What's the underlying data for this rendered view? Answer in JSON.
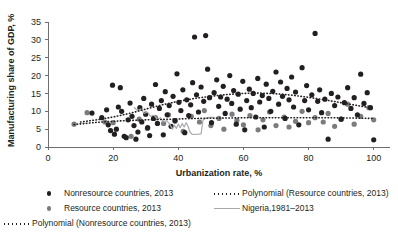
{
  "chart_data": {
    "type": "scatter",
    "title": "",
    "xlabel": "Urbanization rate, %",
    "ylabel": "Manufacturing share of GDP, %",
    "xlim": [
      0,
      105
    ],
    "ylim": [
      0,
      35
    ],
    "xticks": [
      0,
      20,
      40,
      60,
      80,
      100
    ],
    "yticks": [
      0,
      5,
      10,
      15,
      20,
      25,
      30,
      35
    ],
    "grid": false,
    "legend_position": "below",
    "series": [
      {
        "name": "Nonresource countries, 2013",
        "type": "scatter",
        "color": "#231f20",
        "points": [
          [
            13.5,
            9.5
          ],
          [
            16.5,
            8.2
          ],
          [
            18.0,
            10.4
          ],
          [
            18.5,
            6.2
          ],
          [
            19.2,
            4.6
          ],
          [
            19.8,
            17.3
          ],
          [
            20.4,
            3.6
          ],
          [
            21.0,
            5.0
          ],
          [
            21.6,
            11.2
          ],
          [
            22.2,
            16.6
          ],
          [
            22.6,
            10.0
          ],
          [
            23.4,
            3.0
          ],
          [
            24.0,
            2.6
          ],
          [
            24.6,
            7.6
          ],
          [
            25.2,
            12.3
          ],
          [
            25.8,
            8.6
          ],
          [
            26.4,
            6.0
          ],
          [
            27.0,
            2.2
          ],
          [
            27.6,
            4.2
          ],
          [
            28.2,
            11.0
          ],
          [
            28.8,
            7.0
          ],
          [
            29.4,
            13.6
          ],
          [
            30.0,
            9.2
          ],
          [
            30.6,
            5.4
          ],
          [
            31.2,
            3.2
          ],
          [
            31.8,
            12.0
          ],
          [
            32.4,
            8.0
          ],
          [
            33.0,
            17.5
          ],
          [
            33.6,
            6.6
          ],
          [
            34.2,
            10.8
          ],
          [
            34.8,
            13.0
          ],
          [
            35.4,
            3.4
          ],
          [
            36.0,
            15.5
          ],
          [
            36.6,
            9.0
          ],
          [
            37.2,
            11.6
          ],
          [
            37.8,
            5.8
          ],
          [
            38.4,
            14.2
          ],
          [
            39.0,
            7.4
          ],
          [
            39.6,
            20.5
          ],
          [
            40.2,
            12.5
          ],
          [
            40.8,
            10.2
          ],
          [
            41.4,
            16.0
          ],
          [
            42.0,
            4.0
          ],
          [
            42.6,
            13.2
          ],
          [
            43.2,
            8.8
          ],
          [
            43.8,
            11.8
          ],
          [
            44.4,
            18.0
          ],
          [
            45.0,
            30.8
          ],
          [
            45.6,
            14.6
          ],
          [
            46.2,
            9.8
          ],
          [
            47.0,
            16.8
          ],
          [
            47.8,
            12.8
          ],
          [
            48.4,
            31.2
          ],
          [
            49.0,
            21.8
          ],
          [
            49.6,
            13.8
          ],
          [
            50.2,
            6.8
          ],
          [
            51.0,
            15.2
          ],
          [
            51.8,
            18.8
          ],
          [
            52.4,
            11.4
          ],
          [
            53.0,
            14.0
          ],
          [
            53.8,
            17.0
          ],
          [
            54.4,
            9.4
          ],
          [
            55.0,
            13.4
          ],
          [
            55.8,
            20.0
          ],
          [
            56.4,
            12.2
          ],
          [
            57.0,
            15.8
          ],
          [
            57.8,
            6.4
          ],
          [
            58.4,
            14.8
          ],
          [
            59.0,
            10.6
          ],
          [
            59.8,
            18.4
          ],
          [
            60.4,
            4.8
          ],
          [
            61.0,
            13.0
          ],
          [
            61.8,
            16.2
          ],
          [
            62.4,
            11.0
          ],
          [
            63.0,
            15.0
          ],
          [
            63.8,
            8.4
          ],
          [
            64.4,
            19.2
          ],
          [
            65.0,
            12.6
          ],
          [
            65.8,
            14.4
          ],
          [
            66.4,
            5.6
          ],
          [
            67.0,
            17.6
          ],
          [
            67.8,
            13.6
          ],
          [
            68.4,
            10.0
          ],
          [
            69.0,
            15.6
          ],
          [
            70.0,
            21.0
          ],
          [
            70.8,
            12.0
          ],
          [
            71.4,
            18.2
          ],
          [
            72.0,
            14.2
          ],
          [
            72.8,
            8.0
          ],
          [
            73.4,
            16.4
          ],
          [
            74.0,
            13.2
          ],
          [
            74.8,
            19.6
          ],
          [
            75.4,
            11.2
          ],
          [
            76.0,
            15.4
          ],
          [
            77.0,
            6.2
          ],
          [
            78.0,
            22.2
          ],
          [
            78.8,
            13.0
          ],
          [
            79.4,
            17.2
          ],
          [
            80.0,
            10.4
          ],
          [
            81.0,
            14.6
          ],
          [
            82.0,
            31.8
          ],
          [
            82.8,
            12.8
          ],
          [
            83.4,
            16.0
          ],
          [
            84.0,
            9.6
          ],
          [
            85.0,
            13.4
          ],
          [
            86.0,
            2.2
          ],
          [
            87.0,
            15.0
          ],
          [
            88.0,
            11.6
          ],
          [
            89.0,
            14.0
          ],
          [
            90.0,
            7.8
          ],
          [
            91.0,
            12.4
          ],
          [
            92.0,
            16.6
          ],
          [
            93.0,
            10.8
          ],
          [
            94.0,
            13.8
          ],
          [
            95.0,
            9.0
          ],
          [
            96.0,
            20.4
          ],
          [
            97.0,
            12.2
          ],
          [
            98.0,
            15.2
          ],
          [
            99.0,
            11.0
          ],
          [
            100.0,
            2.0
          ]
        ]
      },
      {
        "name": "Resource countries, 2013",
        "type": "scatter",
        "color": "#7b7c7f",
        "points": [
          [
            8.0,
            6.4
          ],
          [
            12.0,
            9.6
          ],
          [
            17.5,
            7.0
          ],
          [
            20.0,
            6.8
          ],
          [
            25.5,
            3.0
          ],
          [
            28.0,
            7.8
          ],
          [
            30.5,
            5.2
          ],
          [
            33.0,
            8.2
          ],
          [
            35.5,
            6.6
          ],
          [
            37.0,
            9.0
          ],
          [
            39.0,
            7.2
          ],
          [
            41.5,
            4.4
          ],
          [
            44.0,
            8.6
          ],
          [
            46.5,
            7.0
          ],
          [
            48.0,
            10.2
          ],
          [
            50.0,
            6.0
          ],
          [
            52.5,
            8.0
          ],
          [
            54.0,
            5.0
          ],
          [
            56.5,
            9.2
          ],
          [
            58.0,
            7.4
          ],
          [
            60.0,
            6.2
          ],
          [
            62.0,
            8.8
          ],
          [
            64.5,
            4.8
          ],
          [
            66.0,
            7.6
          ],
          [
            68.0,
            9.8
          ],
          [
            70.0,
            6.0
          ],
          [
            72.5,
            8.4
          ],
          [
            74.0,
            5.6
          ],
          [
            76.0,
            7.2
          ],
          [
            78.0,
            10.0
          ],
          [
            80.0,
            6.8
          ],
          [
            82.0,
            8.2
          ],
          [
            84.5,
            7.0
          ],
          [
            86.0,
            9.4
          ],
          [
            88.0,
            5.8
          ],
          [
            90.0,
            7.8
          ],
          [
            92.0,
            12.0
          ],
          [
            94.0,
            6.4
          ],
          [
            96.0,
            8.6
          ],
          [
            98.5,
            11.0
          ],
          [
            100.0,
            7.6
          ]
        ]
      }
    ],
    "trendlines": [
      {
        "name": "Polynomial (Nonresource countries, 2013)",
        "style": "dotted",
        "color": "#231f20",
        "points": [
          [
            10,
            7.0
          ],
          [
            15,
            7.6
          ],
          [
            20,
            8.4
          ],
          [
            25,
            9.4
          ],
          [
            30,
            10.6
          ],
          [
            35,
            11.8
          ],
          [
            40,
            12.8
          ],
          [
            45,
            13.6
          ],
          [
            50,
            14.2
          ],
          [
            55,
            14.7
          ],
          [
            60,
            15.0
          ],
          [
            65,
            15.1
          ],
          [
            70,
            14.9
          ],
          [
            75,
            14.5
          ],
          [
            80,
            13.9
          ],
          [
            85,
            13.2
          ],
          [
            90,
            12.4
          ],
          [
            95,
            11.6
          ],
          [
            100,
            10.8
          ]
        ]
      },
      {
        "name": "Polynomial (Resource countries, 2013)",
        "style": "dotted",
        "color": "#231f20",
        "points": [
          [
            8,
            6.3
          ],
          [
            15,
            6.9
          ],
          [
            22,
            7.3
          ],
          [
            30,
            7.6
          ],
          [
            38,
            7.8
          ],
          [
            46,
            8.0
          ],
          [
            54,
            8.1
          ],
          [
            62,
            8.2
          ],
          [
            70,
            8.2
          ],
          [
            78,
            8.2
          ],
          [
            86,
            8.2
          ],
          [
            94,
            8.1
          ],
          [
            100,
            8.0
          ]
        ]
      }
    ],
    "reference_line": {
      "name": "Nigeria,1981–2013",
      "style": "solid",
      "color": "#a7a9ac",
      "points": [
        [
          26.5,
          11.0
        ],
        [
          27.5,
          10.2
        ],
        [
          28.5,
          10.6
        ],
        [
          29.5,
          9.4
        ],
        [
          30.5,
          9.8
        ],
        [
          31.5,
          8.6
        ],
        [
          32.5,
          8.9
        ],
        [
          33.5,
          7.8
        ],
        [
          34.5,
          8.2
        ],
        [
          35.5,
          7.0
        ],
        [
          36.5,
          7.4
        ],
        [
          37.5,
          6.2
        ],
        [
          38.2,
          5.0
        ],
        [
          38.8,
          6.1
        ],
        [
          39.4,
          5.2
        ],
        [
          40.0,
          6.4
        ],
        [
          40.6,
          5.4
        ],
        [
          41.2,
          6.6
        ],
        [
          41.8,
          5.6
        ],
        [
          42.4,
          6.8
        ],
        [
          43.0,
          5.8
        ],
        [
          43.6,
          4.2
        ],
        [
          44.2,
          3.6
        ],
        [
          45.0,
          3.5
        ],
        [
          46.2,
          3.6
        ],
        [
          47.0,
          3.7
        ],
        [
          47.6,
          7.6
        ],
        [
          48.2,
          8.0
        ],
        [
          49.0,
          8.2
        ],
        [
          50.0,
          8.3
        ],
        [
          51.0,
          8.3
        ]
      ]
    }
  },
  "legend": {
    "items": [
      {
        "key": "dot-dark",
        "label": "Nonresource countries, 2013"
      },
      {
        "key": "dot-gray",
        "label": "Resource countries, 2013"
      },
      {
        "key": "dotted-dark",
        "label": "Polynomial (Nonresource countries, 2013)"
      },
      {
        "key": "dotted-dark",
        "label": "Polynomial (Resource countries, 2013)"
      },
      {
        "key": "solid-gray",
        "label": "Nigeria,1981–2013"
      }
    ]
  },
  "axes": {
    "x_title": "Urbanization rate, %",
    "y_title": "Manufacturing share of GDP, %",
    "x_tick_labels": [
      "0",
      "20",
      "40",
      "60",
      "80",
      "100"
    ],
    "y_tick_labels": [
      "0",
      "5",
      "10",
      "15",
      "20",
      "25",
      "30",
      "35"
    ]
  },
  "colors": {
    "nonresource": "#231f20",
    "resource": "#7b7c7f",
    "nigeria": "#a7a9ac",
    "axis": "#6d6e71",
    "background": "#ffffff"
  }
}
